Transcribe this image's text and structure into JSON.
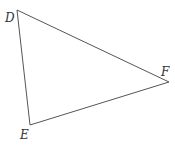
{
  "diagram": {
    "type": "triangle",
    "vertices": [
      {
        "label": "D",
        "x": 17,
        "y": 10,
        "label_x": 5,
        "label_y": 22
      },
      {
        "label": "E",
        "x": 30,
        "y": 125,
        "label_x": 20,
        "label_y": 139
      },
      {
        "label": "F",
        "x": 169,
        "y": 82,
        "label_x": 161,
        "label_y": 76
      }
    ],
    "stroke_color": "#555555"
  }
}
